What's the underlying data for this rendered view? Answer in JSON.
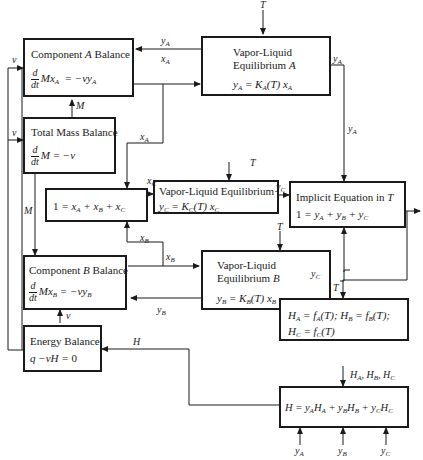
{
  "diagram": {
    "type": "information-flow block diagram",
    "blocks": {
      "component_a": {
        "title": "Component A Balance",
        "equation": "d/dt Mx_A = −vy_A"
      },
      "vle_a": {
        "title_line1": "Vapor-Liquid",
        "title_line2": "Equilibrium A",
        "equation": "y_A = K_A(T) x_A"
      },
      "total_mass": {
        "title": "Total Mass Balance",
        "equation": "d/dt M = −v"
      },
      "sum_x": {
        "equation": "1 = x_A + x_B + x_C"
      },
      "vle_c": {
        "title": "Vapor-Liquid Equilibrium",
        "equation": "y_C = K_C(T) x_C"
      },
      "implicit_t": {
        "title": "Implicit Equation in T",
        "equation": "1 = y_A + y_B + y_C"
      },
      "component_b": {
        "title": "Component B Balance",
        "equation": "d/dt Mx_B = −vy_B"
      },
      "vle_b": {
        "title_line1": "Vapor-Liquid",
        "title_line2": "Equilibrium B",
        "equation": "y_B = K_B(T) x_B"
      },
      "energy": {
        "title": "Energy Balance",
        "equation": "q −vH = 0"
      },
      "enthalpy_funcs": {
        "line1": "H_A = f_A(T); H_B = f_B(T);",
        "line2": "H_C = f_C(T)"
      },
      "mixture_enthalpy": {
        "equation": "H = y_A H_A + y_B H_B + y_C H_C"
      }
    },
    "signals": {
      "v": "v",
      "M": "M",
      "T": "T",
      "H": "H",
      "yA": "y_A",
      "yB": "y_B",
      "yC": "y_C",
      "xA": "x_A",
      "xB": "x_B",
      "xC": "x_C",
      "HABC": "H_A, H_B, H_C"
    },
    "colors": {
      "line": "#1a1a1a",
      "background": "#ffffff"
    }
  }
}
